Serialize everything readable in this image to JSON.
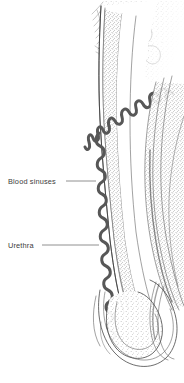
{
  "figure": {
    "type": "anatomical-illustration",
    "style": "stippled pen-and-ink line drawing, grayscale",
    "background_color": "#ffffff",
    "ink_color": "#3c3c3c",
    "text_color": "#3b3b3b",
    "sinus_color": "#575757",
    "width": 184,
    "height": 383
  },
  "labels": [
    {
      "id": "blood-sinuses",
      "text": "Blood sinuses",
      "text_x": 8,
      "text_y": 184,
      "leader_from_x": 66,
      "leader_to_x": 96,
      "leader_y": 181
    },
    {
      "id": "urethra",
      "text": "Urethra",
      "text_x": 8,
      "text_y": 248,
      "leader_from_x": 42,
      "leader_to_x": 99,
      "leader_y": 245
    }
  ],
  "structures": [
    {
      "id": "shaft-outer-wall",
      "name": "Outer shaft wall"
    },
    {
      "id": "tunica-layer",
      "name": "Tunica albuginea layer"
    },
    {
      "id": "corpus-cavernosum",
      "name": "Corpus cavernosum (stippled erectile tissue)"
    },
    {
      "id": "blood-sinus-coil",
      "name": "Coiled blood sinuses / helicine vessels"
    },
    {
      "id": "urethral-canal",
      "name": "Urethral canal"
    },
    {
      "id": "corpus-spongiosum",
      "name": "Corpus spongiosum"
    },
    {
      "id": "glans",
      "name": "Glans penis"
    },
    {
      "id": "prepuce-fold",
      "name": "Prepuce fold"
    },
    {
      "id": "pubic-hair",
      "name": "Pubic hair strokes at base"
    }
  ]
}
